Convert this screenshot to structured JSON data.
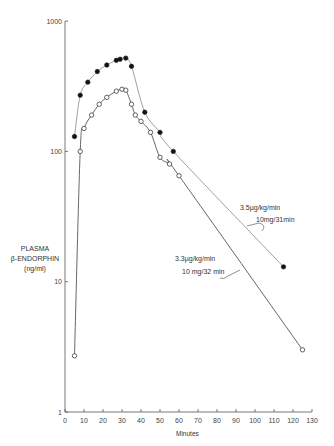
{
  "chart_data": {
    "type": "line",
    "title": "",
    "xlabel": "Minutes",
    "ylabel": "PLASMA β-ENDORPHIN (ng/ml)",
    "ylabel_lines": [
      "PLASMA",
      "β-ENDORPHIN",
      "(ng/ml)"
    ],
    "yscale": "log",
    "xlim": [
      0,
      130
    ],
    "ylim": [
      1,
      1000
    ],
    "x_ticks": [
      0,
      10,
      20,
      30,
      40,
      50,
      60,
      70,
      80,
      90,
      100,
      110,
      120,
      130
    ],
    "y_ticks": [
      1,
      10,
      100,
      1000
    ],
    "y_tick_labels": [
      "1",
      "10",
      "100",
      "1000"
    ],
    "grid": false,
    "series": [
      {
        "name": "3.5 µg/kg/min, 10 mg/31 min",
        "marker": "filled-circle",
        "annotation_line1": "3.5µg/kg/min",
        "annotation_line2": "10mg/31min",
        "x": [
          5,
          8,
          12,
          17,
          22,
          27,
          29,
          32,
          35,
          42,
          50,
          57,
          115
        ],
        "values": [
          130,
          270,
          340,
          410,
          460,
          500,
          510,
          520,
          450,
          200,
          140,
          100,
          13
        ]
      },
      {
        "name": "3.3 µg/kg/min, 10 mg/32 min",
        "marker": "open-circle",
        "annotation_line1": "3.3µg/kg/min",
        "annotation_line2": "10 mg/32 min",
        "x": [
          5,
          8,
          10,
          14,
          18,
          22,
          27,
          30,
          32,
          35,
          37,
          40,
          45,
          50,
          55,
          60,
          125
        ],
        "values": [
          2.7,
          100,
          150,
          190,
          230,
          260,
          290,
          300,
          295,
          230,
          190,
          170,
          140,
          90,
          80,
          65,
          3
        ]
      }
    ]
  }
}
